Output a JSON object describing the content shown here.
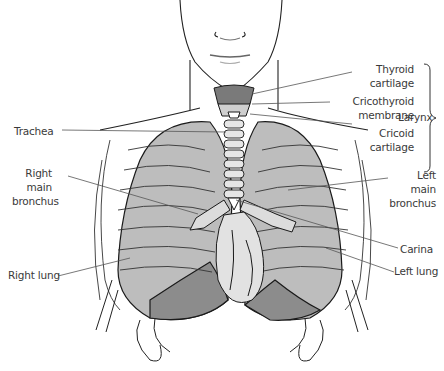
{
  "diagram": {
    "colors": {
      "line": "#1a1a1a",
      "lung_fill": "#b9b9b9",
      "lung_dark": "#8a8a8a",
      "label_text": "#3a3a3a",
      "leader_line": "#555555"
    },
    "labels": {
      "thyroid_cartilage": "Thyroid\ncartilage",
      "cricothyroid_membrane": "Cricothyroid\nmembrane",
      "cricoid_cartilage": "Cricoid\ncartilage",
      "larynx": "Larynx",
      "trachea": "Trachea",
      "right_main_bronchus": "Right\nmain\nbronchus",
      "left_main_bronchus": "Left\nmain\nbronchus",
      "carina": "Carina",
      "right_lung": "Right lung",
      "left_lung": "Left lung"
    }
  }
}
